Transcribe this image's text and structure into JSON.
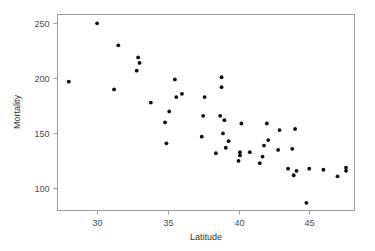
{
  "chart_data": {
    "type": "scatter",
    "title": "",
    "xlabel": "Latitude",
    "ylabel": "Mortality",
    "xlim": [
      27.2,
      48.2
    ],
    "ylim": [
      80,
      258
    ],
    "xticks": [
      30,
      35,
      40,
      45
    ],
    "yticks": [
      100,
      150,
      200,
      250
    ],
    "grid": false,
    "legend": null,
    "marker": "filled-circle",
    "marker_color": "#0d0d0d",
    "points": [
      {
        "x": 28.0,
        "y": 197
      },
      {
        "x": 30.0,
        "y": 250
      },
      {
        "x": 31.2,
        "y": 190
      },
      {
        "x": 31.5,
        "y": 230
      },
      {
        "x": 32.8,
        "y": 207
      },
      {
        "x": 32.9,
        "y": 219
      },
      {
        "x": 33.0,
        "y": 214
      },
      {
        "x": 33.8,
        "y": 178
      },
      {
        "x": 34.8,
        "y": 160
      },
      {
        "x": 34.9,
        "y": 141
      },
      {
        "x": 35.1,
        "y": 170
      },
      {
        "x": 35.5,
        "y": 199
      },
      {
        "x": 35.6,
        "y": 183
      },
      {
        "x": 36.0,
        "y": 186
      },
      {
        "x": 37.4,
        "y": 147
      },
      {
        "x": 37.5,
        "y": 166
      },
      {
        "x": 37.6,
        "y": 183
      },
      {
        "x": 38.4,
        "y": 132
      },
      {
        "x": 38.7,
        "y": 166
      },
      {
        "x": 38.8,
        "y": 192
      },
      {
        "x": 38.8,
        "y": 201
      },
      {
        "x": 38.9,
        "y": 150
      },
      {
        "x": 39.0,
        "y": 162
      },
      {
        "x": 39.1,
        "y": 137
      },
      {
        "x": 39.3,
        "y": 143
      },
      {
        "x": 40.0,
        "y": 125
      },
      {
        "x": 40.1,
        "y": 130
      },
      {
        "x": 40.1,
        "y": 133
      },
      {
        "x": 40.2,
        "y": 159
      },
      {
        "x": 40.8,
        "y": 133
      },
      {
        "x": 41.5,
        "y": 123
      },
      {
        "x": 41.7,
        "y": 129
      },
      {
        "x": 41.8,
        "y": 139
      },
      {
        "x": 42.0,
        "y": 159
      },
      {
        "x": 42.1,
        "y": 144
      },
      {
        "x": 42.8,
        "y": 135
      },
      {
        "x": 42.9,
        "y": 153
      },
      {
        "x": 43.5,
        "y": 118
      },
      {
        "x": 43.8,
        "y": 136
      },
      {
        "x": 43.9,
        "y": 112
      },
      {
        "x": 44.0,
        "y": 154
      },
      {
        "x": 44.1,
        "y": 116
      },
      {
        "x": 44.8,
        "y": 87
      },
      {
        "x": 45.0,
        "y": 118
      },
      {
        "x": 46.0,
        "y": 117
      },
      {
        "x": 47.0,
        "y": 111
      },
      {
        "x": 47.6,
        "y": 116
      },
      {
        "x": 47.6,
        "y": 119
      }
    ]
  },
  "axes": {
    "x_tick_labels": [
      "30",
      "35",
      "40",
      "45"
    ],
    "y_tick_labels": [
      "100",
      "150",
      "200",
      "250"
    ],
    "x_axis_title": "Latitude",
    "y_axis_title": "Mortality"
  }
}
